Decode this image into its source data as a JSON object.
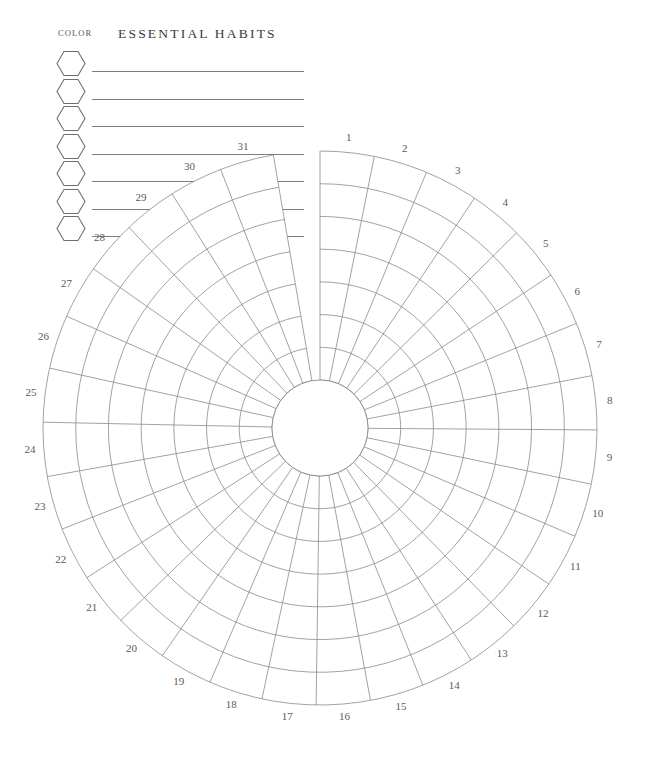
{
  "legend": {
    "color_label": "COLOR",
    "title": "ESSENTIAL HABITS",
    "swatch_icon": "hexagon-icon",
    "rows": [
      {
        "index": 1,
        "habit_name": ""
      },
      {
        "index": 2,
        "habit_name": ""
      },
      {
        "index": 3,
        "habit_name": ""
      },
      {
        "index": 4,
        "habit_name": ""
      },
      {
        "index": 5,
        "habit_name": ""
      },
      {
        "index": 6,
        "habit_name": ""
      },
      {
        "index": 7,
        "habit_name": ""
      }
    ]
  },
  "chart_data": {
    "type": "heatmap",
    "title": "ESSENTIAL HABITS",
    "subtype": "radial-habit-tracker",
    "categories": [
      "1",
      "2",
      "3",
      "4",
      "5",
      "6",
      "7",
      "8",
      "9",
      "10",
      "11",
      "12",
      "13",
      "14",
      "15",
      "16",
      "17",
      "18",
      "19",
      "20",
      "21",
      "22",
      "23",
      "24",
      "25",
      "26",
      "27",
      "28",
      "29",
      "30",
      "31"
    ],
    "xlabel": "Day of month",
    "ylabel": "Habit ring",
    "rings": 7,
    "ring_labels": [
      "1",
      "2",
      "3",
      "4",
      "5",
      "6",
      "7"
    ],
    "series": [
      {
        "name": "Habit 1",
        "values": [
          0,
          0,
          0,
          0,
          0,
          0,
          0,
          0,
          0,
          0,
          0,
          0,
          0,
          0,
          0,
          0,
          0,
          0,
          0,
          0,
          0,
          0,
          0,
          0,
          0,
          0,
          0,
          0,
          0,
          0,
          0
        ]
      },
      {
        "name": "Habit 2",
        "values": [
          0,
          0,
          0,
          0,
          0,
          0,
          0,
          0,
          0,
          0,
          0,
          0,
          0,
          0,
          0,
          0,
          0,
          0,
          0,
          0,
          0,
          0,
          0,
          0,
          0,
          0,
          0,
          0,
          0,
          0,
          0
        ]
      },
      {
        "name": "Habit 3",
        "values": [
          0,
          0,
          0,
          0,
          0,
          0,
          0,
          0,
          0,
          0,
          0,
          0,
          0,
          0,
          0,
          0,
          0,
          0,
          0,
          0,
          0,
          0,
          0,
          0,
          0,
          0,
          0,
          0,
          0,
          0,
          0
        ]
      },
      {
        "name": "Habit 4",
        "values": [
          0,
          0,
          0,
          0,
          0,
          0,
          0,
          0,
          0,
          0,
          0,
          0,
          0,
          0,
          0,
          0,
          0,
          0,
          0,
          0,
          0,
          0,
          0,
          0,
          0,
          0,
          0,
          0,
          0,
          0,
          0
        ]
      },
      {
        "name": "Habit 5",
        "values": [
          0,
          0,
          0,
          0,
          0,
          0,
          0,
          0,
          0,
          0,
          0,
          0,
          0,
          0,
          0,
          0,
          0,
          0,
          0,
          0,
          0,
          0,
          0,
          0,
          0,
          0,
          0,
          0,
          0,
          0,
          0
        ]
      },
      {
        "name": "Habit 6",
        "values": [
          0,
          0,
          0,
          0,
          0,
          0,
          0,
          0,
          0,
          0,
          0,
          0,
          0,
          0,
          0,
          0,
          0,
          0,
          0,
          0,
          0,
          0,
          0,
          0,
          0,
          0,
          0,
          0,
          0,
          0,
          0
        ]
      },
      {
        "name": "Habit 7",
        "values": [
          0,
          0,
          0,
          0,
          0,
          0,
          0,
          0,
          0,
          0,
          0,
          0,
          0,
          0,
          0,
          0,
          0,
          0,
          0,
          0,
          0,
          0,
          0,
          0,
          0,
          0,
          0,
          0,
          0,
          0,
          0
        ]
      }
    ],
    "grid": true,
    "legend_position": "top-left",
    "geometry": {
      "center_x": 320,
      "center_y": 428,
      "inner_radius": 48,
      "outer_radius": 277,
      "start_angle_deg": 0,
      "sector_span_deg": 11.3,
      "label_radius": 291
    },
    "colors": {
      "stroke": "#8a8a8a",
      "label": "#5a5a5a",
      "background": "#ffffff",
      "title": "#3a3a3a"
    }
  }
}
